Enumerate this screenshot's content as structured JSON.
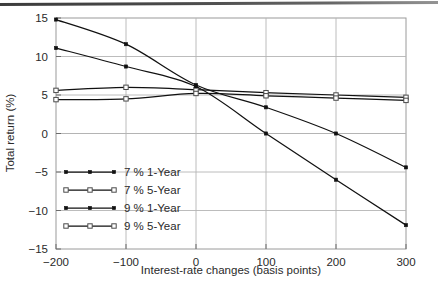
{
  "chart_data": {
    "type": "line",
    "title": "",
    "xlabel": "Interest-rate changes (basis points)",
    "ylabel": "Total return (%)",
    "x": [
      -200,
      -100,
      0,
      100,
      200,
      300
    ],
    "xlim": [
      -200,
      300
    ],
    "ylim": [
      -15,
      15
    ],
    "xticks": [
      -200,
      -100,
      0,
      100,
      200,
      300
    ],
    "yticks": [
      15,
      10,
      5,
      0,
      -5,
      -10,
      -15
    ],
    "xticklabels": [
      "-200",
      "-100",
      "0",
      "100",
      "200",
      "300"
    ],
    "yticklabels": [
      "15",
      "10",
      "5",
      "0",
      "-5",
      "-10",
      "-15"
    ],
    "grid": "horizontal-and-vertical-light",
    "legend_position": "lower-left-inside",
    "series": [
      {
        "name": "7 % 1-Year",
        "marker": "filled-square",
        "values": [
          14.8,
          11.6,
          6.3,
          3.4,
          0.0,
          -4.4
        ]
      },
      {
        "name": "7 % 5-Year",
        "marker": "open-square",
        "values": [
          5.6,
          6.0,
          5.7,
          5.3,
          5.0,
          4.7
        ]
      },
      {
        "name": "9 % 1-Year",
        "marker": "filled-square",
        "values": [
          11.1,
          8.7,
          6.1,
          0.0,
          -6.0,
          -11.9
        ]
      },
      {
        "name": "9 % 5-Year",
        "marker": "open-square",
        "values": [
          4.4,
          4.5,
          5.2,
          4.9,
          4.6,
          4.3
        ]
      }
    ]
  },
  "colors": {
    "line": "#111111",
    "frame": "#9a9a9a",
    "grid": "#b4b4b4",
    "text": "#2a2a2a",
    "background": "#ffffff"
  },
  "legend": {
    "items": [
      {
        "label": "7 % 1-Year",
        "marker": "filled-square"
      },
      {
        "label": "7 % 5-Year",
        "marker": "open-square"
      },
      {
        "label": "9 % 1-Year",
        "marker": "filled-square"
      },
      {
        "label": "9 % 5-Year",
        "marker": "open-square"
      }
    ]
  }
}
